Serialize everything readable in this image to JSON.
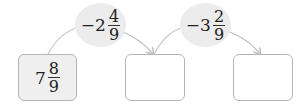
{
  "diagram": {
    "start_box": {
      "whole": "7",
      "numerator": "8",
      "denominator": "9"
    },
    "operations": [
      {
        "sign": "−",
        "whole": "2",
        "numerator": "4",
        "denominator": "9"
      },
      {
        "sign": "−",
        "whole": "3",
        "numerator": "2",
        "denominator": "9"
      }
    ],
    "answer_boxes": [
      "",
      ""
    ],
    "colors": {
      "box_border": "#b5b5b5",
      "oval_fill": "#ececec",
      "arrow": "#bdbdbd",
      "start_fill": "#efefef"
    }
  }
}
